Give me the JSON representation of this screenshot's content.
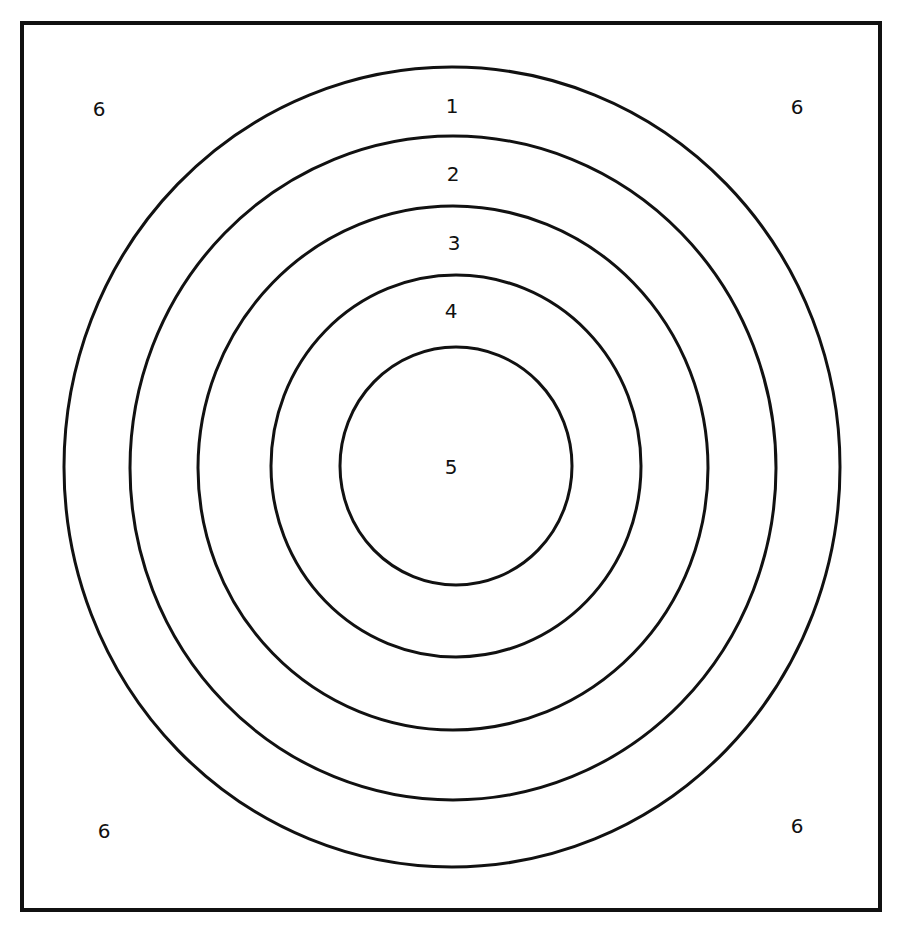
{
  "diagram": {
    "type": "concentric-target-zones",
    "stroke_color": "#111111",
    "background_color": "#ffffff",
    "frame": {
      "x": 22,
      "y": 23,
      "width": 858,
      "height": 887
    },
    "rings": [
      {
        "name": "ring-outer",
        "cx": 452,
        "cy": 467,
        "rx": 388,
        "ry": 400
      },
      {
        "name": "ring-2",
        "cx": 453,
        "cy": 468,
        "rx": 323,
        "ry": 332
      },
      {
        "name": "ring-3",
        "cx": 453,
        "cy": 468,
        "rx": 255,
        "ry": 262
      },
      {
        "name": "ring-4",
        "cx": 456,
        "cy": 466,
        "rx": 185,
        "ry": 191
      },
      {
        "name": "ring-inner",
        "cx": 456,
        "cy": 466,
        "rx": 116,
        "ry": 119
      }
    ],
    "labels": [
      {
        "text": "1",
        "x": 452,
        "y": 106
      },
      {
        "text": "2",
        "x": 453,
        "y": 174
      },
      {
        "text": "3",
        "x": 454,
        "y": 243
      },
      {
        "text": "4",
        "x": 451,
        "y": 311
      },
      {
        "text": "5",
        "x": 451,
        "y": 467
      },
      {
        "text": "6",
        "x": 99,
        "y": 109
      },
      {
        "text": "6",
        "x": 797,
        "y": 107
      },
      {
        "text": "6",
        "x": 104,
        "y": 831
      },
      {
        "text": "6",
        "x": 797,
        "y": 826
      }
    ]
  }
}
